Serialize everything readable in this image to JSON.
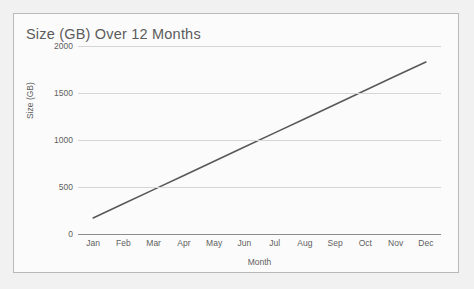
{
  "chart_data": {
    "type": "line",
    "title": "Size (GB) Over 12 Months",
    "xlabel": "Month",
    "ylabel": "Size (GB)",
    "categories": [
      "Jan",
      "Feb",
      "Mar",
      "Apr",
      "May",
      "Jun",
      "Jul",
      "Aug",
      "Sep",
      "Oct",
      "Nov",
      "Dec"
    ],
    "values": [
      170,
      321,
      472,
      623,
      774,
      925,
      1076,
      1227,
      1378,
      1529,
      1680,
      1830
    ],
    "series": [
      {
        "name": "Size (GB)",
        "values": [
          170,
          321,
          472,
          623,
          774,
          925,
          1076,
          1227,
          1378,
          1529,
          1680,
          1830
        ],
        "color": "#595959"
      }
    ],
    "yticks": [
      0,
      500,
      1000,
      1500,
      2000
    ],
    "ytick_labels": [
      "0",
      "500",
      "1000",
      "1500",
      "2000"
    ],
    "ylim": [
      0,
      2000
    ],
    "grid": true,
    "grid_color": "#d6d6d6",
    "axis_color": "#8d8d8d",
    "legend": false,
    "legend_position": "none",
    "markers": false,
    "line_width": 1.6,
    "background": "#fbfbfb",
    "border_color": "#b9b9b9",
    "text_color": "#5f5f5f",
    "title_color": "#5c5c5c"
  }
}
